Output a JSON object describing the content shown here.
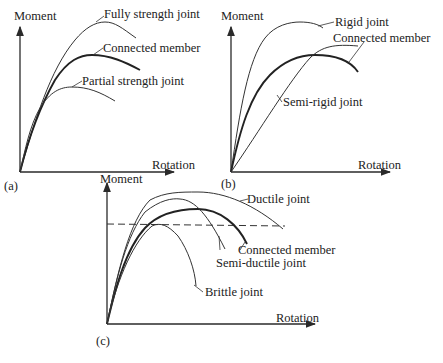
{
  "figure": {
    "panels": [
      {
        "id": "a",
        "tag": "(a)",
        "y_axis_label": "Moment",
        "x_axis_label": "Rotation",
        "curves": [
          {
            "label": "Fully strength joint",
            "style": "thin"
          },
          {
            "label": "Connected member",
            "style": "thick"
          },
          {
            "label": "Partial strength joint",
            "style": "thin"
          }
        ]
      },
      {
        "id": "b",
        "tag": "(b)",
        "y_axis_label": "Moment",
        "x_axis_label": "Rotation",
        "curves": [
          {
            "label": "Rigid joint",
            "style": "thin"
          },
          {
            "label": "Connected member",
            "style": "thick"
          },
          {
            "label": "Semi-rigid joint",
            "style": "thin"
          }
        ]
      },
      {
        "id": "c",
        "tag": "(c)",
        "y_axis_label": "Moment",
        "x_axis_label": "Rotation",
        "reference_line": "dashed horizontal",
        "curves": [
          {
            "label": "Ductile joint",
            "style": "thin"
          },
          {
            "label": "Connected member",
            "style": "thick"
          },
          {
            "label": "Semi-ductile joint",
            "style": "thin"
          },
          {
            "label": "Brittle joint",
            "style": "thin"
          }
        ]
      }
    ]
  }
}
